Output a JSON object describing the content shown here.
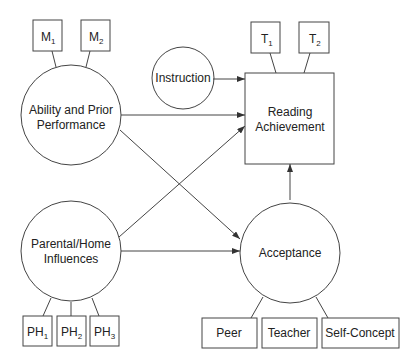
{
  "nodes": {
    "ability": {
      "line1": "Ability and Prior",
      "line2": "Performance"
    },
    "instruction": {
      "label": "Instruction"
    },
    "reading": {
      "line1": "Reading",
      "line2": "Achievement"
    },
    "parental": {
      "line1": "Parental/Home",
      "line2": "Influences"
    },
    "acceptance": {
      "label": "Acceptance"
    }
  },
  "indicators": {
    "m1": {
      "base": "M",
      "sub": "1"
    },
    "m2": {
      "base": "M",
      "sub": "2"
    },
    "t1": {
      "base": "T",
      "sub": "1"
    },
    "t2": {
      "base": "T",
      "sub": "2"
    },
    "ph1": {
      "base": "PH",
      "sub": "1"
    },
    "ph2": {
      "base": "PH",
      "sub": "2"
    },
    "ph3": {
      "base": "PH",
      "sub": "3"
    },
    "peer": {
      "label": "Peer"
    },
    "teacher": {
      "label": "Teacher"
    },
    "self_concept": {
      "label": "Self-Concept"
    }
  },
  "colors": {
    "stroke": "#444444",
    "text": "#222222",
    "background": "#ffffff"
  }
}
